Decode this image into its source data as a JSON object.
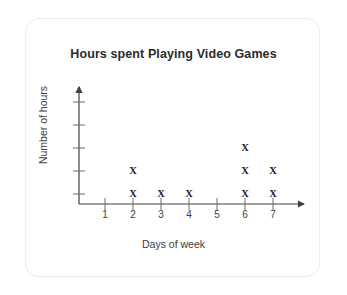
{
  "card": {
    "border_color": "#ececec",
    "background": "#ffffff"
  },
  "chart_data": {
    "type": "scatter",
    "title": "Hours spent Playing Video Games",
    "xlabel": "Days of week",
    "ylabel": "Number of hours",
    "categories": [
      "1",
      "2",
      "3",
      "4",
      "5",
      "6",
      "7"
    ],
    "x": [
      1,
      2,
      3,
      4,
      5,
      6,
      7
    ],
    "values": [
      0,
      2,
      1,
      1,
      0,
      3,
      2
    ],
    "point_marker": "X",
    "xlim": [
      0,
      7.6
    ],
    "ylim": [
      0,
      5
    ],
    "x_ticks": [
      "1",
      "2",
      "3",
      "4",
      "5",
      "6",
      "7"
    ],
    "y_ticks": [
      "",
      "",
      "",
      "",
      ""
    ],
    "y_tick_count": 5,
    "grid": false,
    "legend": "none",
    "axis_arrows": true,
    "points": [
      {
        "x": 2,
        "y": 1
      },
      {
        "x": 2,
        "y": 2
      },
      {
        "x": 3,
        "y": 1
      },
      {
        "x": 4,
        "y": 1
      },
      {
        "x": 6,
        "y": 1
      },
      {
        "x": 6,
        "y": 2
      },
      {
        "x": 6,
        "y": 3
      },
      {
        "x": 7,
        "y": 1
      },
      {
        "x": 7,
        "y": 2
      }
    ],
    "colors": {
      "axis": "#3f3f3f",
      "mark": "#222222",
      "title": "#2b2b2b",
      "label": "#3d3d3d"
    }
  }
}
